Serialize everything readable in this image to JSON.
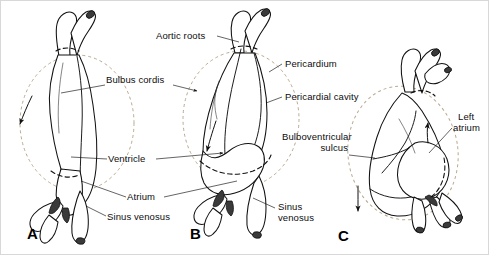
{
  "figure": {
    "type": "anatomical-diagram",
    "background_color": "#ffffff",
    "ink_color": "#0d0d0d",
    "pericardium_dash_color": "#b9a98f"
  },
  "panels": [
    {
      "id": "A",
      "letter": "A"
    },
    {
      "id": "B",
      "letter": "B"
    },
    {
      "id": "C",
      "letter": "C"
    }
  ],
  "labels": {
    "bulbus_cordis": "Bulbus cordis",
    "ventricle": "Ventricle",
    "atrium": "Atrium",
    "sinus_venosus_a": "Sinus venosus",
    "aortic_roots": "Aortic roots",
    "pericardium": "Pericardium",
    "pericardial_cavity": "Pericardial cavity",
    "bulboventricular_sulcus_l1": "Bulboventricular",
    "bulboventricular_sulcus_l2": "sulcus",
    "sinus_venosus_b_l1": "Sinus",
    "sinus_venosus_b_l2": "venosus",
    "left_atrium_l1": "Left",
    "left_atrium_l2": "atrium"
  }
}
